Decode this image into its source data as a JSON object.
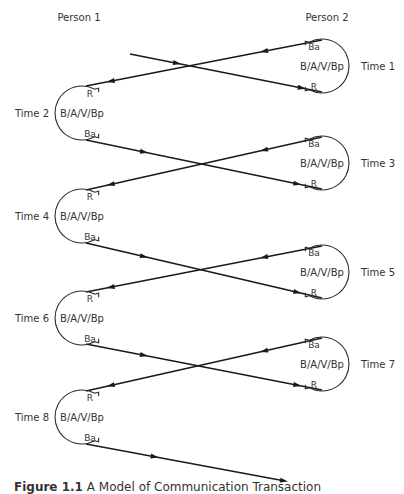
{
  "diagram": {
    "persons": [
      {
        "label": "Person 1",
        "x": 79,
        "y": 21
      },
      {
        "label": "Person 2",
        "x": 327,
        "y": 21
      }
    ],
    "circle_text": "B/A/V/Bp",
    "receive_label": "R",
    "behavior_label": "Ba",
    "radius": 27,
    "nodes": [
      {
        "time": "Time 1",
        "side": "right",
        "cx": 322,
        "cy": 66
      },
      {
        "time": "Time 2",
        "side": "left",
        "cx": 82,
        "cy": 113
      },
      {
        "time": "Time 3",
        "side": "right",
        "cx": 322,
        "cy": 163
      },
      {
        "time": "Time 4",
        "side": "left",
        "cx": 82,
        "cy": 216
      },
      {
        "time": "Time 5",
        "side": "right",
        "cx": 322,
        "cy": 272
      },
      {
        "time": "Time 6",
        "side": "left",
        "cx": 82,
        "cy": 318
      },
      {
        "time": "Time 7",
        "side": "right",
        "cx": 322,
        "cy": 364
      },
      {
        "time": "Time 8",
        "side": "left",
        "cx": 82,
        "cy": 417
      }
    ],
    "arrows": [
      {
        "from": [
          322,
          40
        ],
        "to": [
          86,
          86
        ],
        "mid": "left"
      },
      {
        "from": [
          130,
          54
        ],
        "to": [
          322,
          92
        ],
        "mid": "right"
      },
      {
        "from": [
          86,
          140
        ],
        "to": [
          322,
          189
        ],
        "mid": "right"
      },
      {
        "from": [
          322,
          137
        ],
        "to": [
          86,
          190
        ],
        "mid": "left"
      },
      {
        "from": [
          86,
          243
        ],
        "to": [
          322,
          298
        ],
        "mid": "right"
      },
      {
        "from": [
          322,
          246
        ],
        "to": [
          86,
          292
        ],
        "mid": "left"
      },
      {
        "from": [
          86,
          344
        ],
        "to": [
          322,
          390
        ],
        "mid": "right"
      },
      {
        "from": [
          322,
          338
        ],
        "to": [
          86,
          391
        ],
        "mid": "left"
      },
      {
        "from": [
          86,
          444
        ],
        "to": [
          285,
          481
        ],
        "mid": "end"
      }
    ]
  },
  "caption": {
    "number": "Figure 1.1",
    "text": "A Model of Communication Transaction"
  }
}
